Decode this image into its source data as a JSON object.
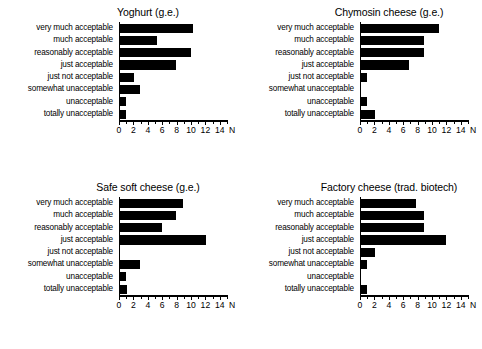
{
  "figure": {
    "categories": [
      "very much acceptable",
      "much acceptable",
      "reasonably acceptable",
      "just acceptable",
      "just not acceptable",
      "somewhat unacceptable",
      "unacceptable",
      "totally unacceptable"
    ],
    "axis_label": "N",
    "tick_labels": [
      "0",
      "2",
      "4",
      "6",
      "8",
      "10",
      "12",
      "14"
    ],
    "bar_color": "#000000",
    "axis_color": "#000000"
  },
  "chart_data": [
    {
      "type": "bar",
      "title": "Yoghurt (g.e.)",
      "orientation": "horizontal",
      "categories": [
        "very much acceptable",
        "much acceptable",
        "reasonably acceptable",
        "just acceptable",
        "just not acceptable",
        "somewhat unacceptable",
        "unacceptable",
        "totally unacceptable"
      ],
      "values": [
        10.1,
        5.2,
        9.9,
        7.8,
        1.9,
        2.8,
        0.8,
        0.9
      ],
      "xlabel": "N",
      "ylabel": "",
      "xlim": [
        0,
        15
      ],
      "xticks": [
        0,
        2,
        4,
        6,
        8,
        10,
        12,
        14
      ],
      "grid": false,
      "legend": "none"
    },
    {
      "type": "bar",
      "title": "Chymosin cheese (g.e.)",
      "orientation": "horizontal",
      "categories": [
        "very much acceptable",
        "much acceptable",
        "reasonably acceptable",
        "just acceptable",
        "just not acceptable",
        "somewhat unacceptable",
        "unacceptable",
        "totally unacceptable"
      ],
      "values": [
        10.8,
        8.7,
        8.7,
        6.7,
        0.8,
        0,
        0.8,
        1.9
      ],
      "xlabel": "N",
      "ylabel": "",
      "xlim": [
        0,
        15
      ],
      "xticks": [
        0,
        2,
        4,
        6,
        8,
        10,
        12,
        14
      ],
      "grid": false,
      "legend": "none"
    },
    {
      "type": "bar",
      "title": "Safe soft cheese (g.e.)",
      "orientation": "horizontal",
      "categories": [
        "very much acceptable",
        "much acceptable",
        "reasonably acceptable",
        "just acceptable",
        "just not acceptable",
        "somewhat unacceptable",
        "unacceptable",
        "totally unacceptable"
      ],
      "values": [
        8.8,
        7.8,
        5.8,
        11.9,
        0,
        2.8,
        0.9,
        1.0
      ],
      "xlabel": "N",
      "ylabel": "",
      "xlim": [
        0,
        15
      ],
      "xticks": [
        0,
        2,
        4,
        6,
        8,
        10,
        12,
        14
      ],
      "grid": false,
      "legend": "none"
    },
    {
      "type": "bar",
      "title": "Factory cheese (trad. biotech)",
      "orientation": "horizontal",
      "categories": [
        "very much acceptable",
        "much acceptable",
        "reasonably acceptable",
        "just acceptable",
        "just not acceptable",
        "somewhat unacceptable",
        "unacceptable",
        "totally unacceptable"
      ],
      "values": [
        7.6,
        8.7,
        8.7,
        11.8,
        1.9,
        0.9,
        0,
        0.8
      ],
      "xlabel": "N",
      "ylabel": "",
      "xlim": [
        0,
        15
      ],
      "xticks": [
        0,
        2,
        4,
        6,
        8,
        10,
        12,
        14
      ],
      "grid": false,
      "legend": "none"
    }
  ]
}
